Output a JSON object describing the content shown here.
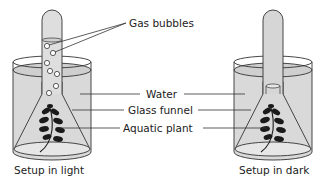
{
  "diagram": {
    "labels": {
      "gas_bubbles": "Gas bubbles",
      "water": "Water",
      "glass_funnel": "Glass funnel",
      "aquatic_plant": "Aquatic plant"
    },
    "captions": {
      "light": "Setup in light",
      "dark": "Setup in dark"
    },
    "colors": {
      "water": "#d9d9d9",
      "outline": "#333333",
      "leaf": "#1a1a1a",
      "text": "#222222"
    },
    "setups": [
      {
        "id": "light",
        "bubbles_in_tube": 6,
        "bubbles_in_neck": 2
      },
      {
        "id": "dark",
        "bubbles_in_tube": 0,
        "bubbles_in_neck": 0
      }
    ]
  }
}
